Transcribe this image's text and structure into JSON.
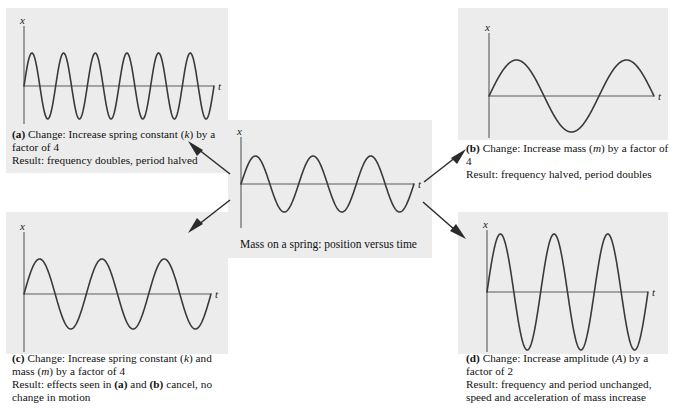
{
  "figure": {
    "title": "Mass on a spring: position versus time",
    "axis_x_label": "x",
    "axis_t_label": "t",
    "panel_bg": "#ececec",
    "curve_color": "#3a3a3a",
    "axis_color": "#5a5a5a"
  },
  "center": {
    "caption": "Mass on a spring: position versus time"
  },
  "panels": [
    {
      "id": "a",
      "tag": "(a)",
      "change_label": "Change:",
      "change_text_1": "Increase spring constant (",
      "change_sym": "k",
      "change_text_2": ") by a factor of 4",
      "result_label": "Result:",
      "result_text": "frequency doubles, period halved",
      "axis_x_label": "x",
      "axis_t_label": "t"
    },
    {
      "id": "b",
      "tag": "(b)",
      "change_label": "Change:",
      "change_text_1": "Increase mass (",
      "change_sym": "m",
      "change_text_2": ") by a factor of 4",
      "result_label": "Result:",
      "result_text": "frequency halved, period doubles",
      "axis_x_label": "x",
      "axis_t_label": "t"
    },
    {
      "id": "c",
      "tag": "(c)",
      "change_label": "Change:",
      "change_text_1": "Increase spring constant (",
      "change_sym": "k",
      "change_text_2": ") and mass (",
      "change_sym2": "m",
      "change_text_3": ") by a factor of 4",
      "result_label": "Result:",
      "result_text_1": "effects seen in ",
      "result_ref_a": "(a)",
      "result_text_2": " and ",
      "result_ref_b": "(b)",
      "result_text_3": " cancel, no change in motion",
      "axis_x_label": "x",
      "axis_t_label": "t"
    },
    {
      "id": "d",
      "tag": "(d)",
      "change_label": "Change:",
      "change_text_1": "Increase amplitude (",
      "change_sym": "A",
      "change_text_2": ") by a factor of 2",
      "result_label": "Result:",
      "result_text": "frequency and period unchanged, speed and acceleration of mass increase",
      "axis_x_label": "x",
      "axis_t_label": "t"
    }
  ],
  "chart_data": {
    "type": "line",
    "title": "Mass on a spring: position versus time",
    "xlabel": "t",
    "ylabel": "x",
    "grid": false,
    "legend": "none",
    "series": [
      {
        "name": "center-reference",
        "function": "x(t) = A sin(2π · 3 t / T_window)",
        "amplitude": 1.0,
        "cycles": 3,
        "phase": 0,
        "ylim": [
          -1.35,
          1.35
        ]
      },
      {
        "name": "a-stiffer-spring",
        "function": "x(t) = A sin(2π · 6 t / T_window)",
        "amplitude": 1.0,
        "cycles": 6,
        "phase": 0,
        "ylim": [
          -1.35,
          1.35
        ]
      },
      {
        "name": "b-heavier-mass",
        "function": "x(t) = A sin(2π · 1.5 t / T_window)",
        "amplitude": 1.0,
        "cycles": 1.5,
        "phase": 0,
        "ylim": [
          -1.35,
          1.35
        ]
      },
      {
        "name": "c-both-increased",
        "function": "x(t) = A sin(2π · 3 t / T_window)",
        "amplitude": 1.0,
        "cycles": 3,
        "phase": 0,
        "ylim": [
          -1.35,
          1.35
        ]
      },
      {
        "name": "d-double-amplitude",
        "function": "x(t) = 2A sin(2π · 3 t / T_window)",
        "amplitude": 2.0,
        "cycles": 3,
        "phase": 0,
        "ylim": [
          -2.4,
          2.4
        ]
      }
    ]
  }
}
